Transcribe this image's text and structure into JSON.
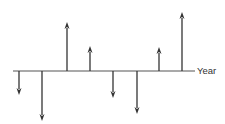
{
  "diagram": {
    "type": "cash-flow-diagram",
    "axis": {
      "label": "Year",
      "y": 71,
      "x_start": 13,
      "x_end": 195,
      "color": "#555555"
    },
    "arrow_color": "#333333",
    "flows": [
      {
        "x": 19,
        "direction": "down",
        "magnitude": 24
      },
      {
        "x": 42,
        "direction": "down",
        "magnitude": 50
      },
      {
        "x": 67,
        "direction": "up",
        "magnitude": 49
      },
      {
        "x": 90,
        "direction": "up",
        "magnitude": 25
      },
      {
        "x": 113,
        "direction": "down",
        "magnitude": 27
      },
      {
        "x": 137,
        "direction": "down",
        "magnitude": 43
      },
      {
        "x": 159,
        "direction": "up",
        "magnitude": 24
      },
      {
        "x": 182,
        "direction": "up",
        "magnitude": 59
      }
    ]
  }
}
